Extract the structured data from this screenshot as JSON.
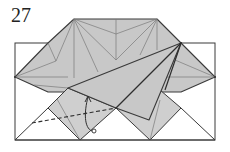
{
  "step": {
    "number": "27"
  },
  "diagram": {
    "paper_color": "#c8c8c8",
    "line_color": "#3a3a3a",
    "background": "#ffffff",
    "annotations": [
      {
        "type": "valley-fold-line",
        "style": "dashed"
      },
      {
        "type": "fold-arrow",
        "direction": "up",
        "meaning": "fold behind/swing up"
      }
    ]
  }
}
